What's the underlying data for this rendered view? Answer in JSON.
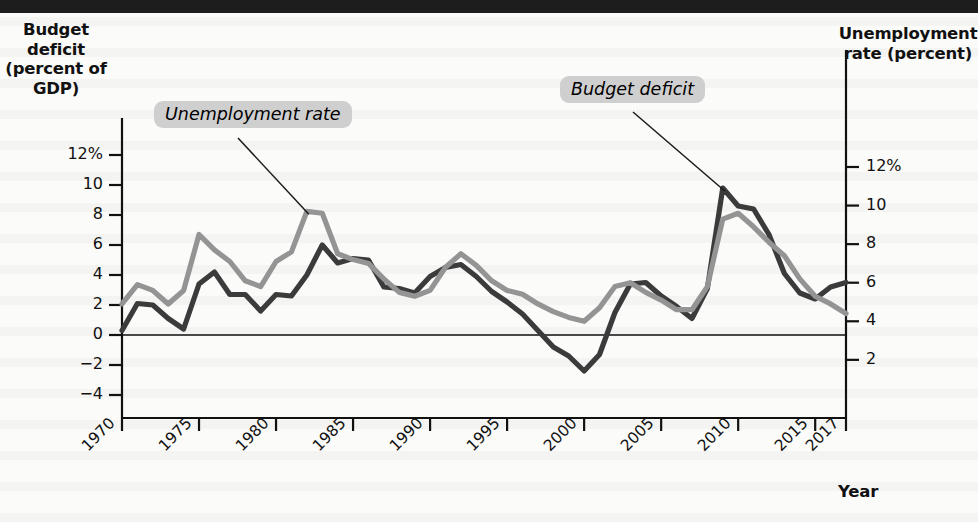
{
  "figure": {
    "left_axis_title": "Budget deficit (percent of GDP)",
    "right_axis_title": "Unemployment rate (percent)",
    "xaxis_title": "Year",
    "callouts": {
      "unemployment": "Unemployment rate",
      "deficit": "Budget deficit"
    },
    "colors": {
      "deficit_line": "#3b3b3b",
      "unemployment_line": "#949494",
      "axis": "#111111",
      "callout_background": "#cfcfcf",
      "page_background": "#fbfbf9",
      "topbar": "#1d1d1d"
    }
  },
  "chart_data": {
    "type": "line",
    "title": "",
    "xlabel": "Year",
    "grid": false,
    "legend_position": "inline-callouts",
    "x": [
      1970,
      1971,
      1972,
      1973,
      1974,
      1975,
      1976,
      1977,
      1978,
      1979,
      1980,
      1981,
      1982,
      1983,
      1984,
      1985,
      1986,
      1987,
      1988,
      1989,
      1990,
      1991,
      1992,
      1993,
      1994,
      1995,
      1996,
      1997,
      1998,
      1999,
      2000,
      2001,
      2002,
      2003,
      2004,
      2005,
      2006,
      2007,
      2008,
      2009,
      2010,
      2011,
      2012,
      2013,
      2014,
      2015,
      2016,
      2017
    ],
    "xtick_labels": [
      "1970",
      "1975",
      "1980",
      "1985",
      "1990",
      "1995",
      "2000",
      "2005",
      "2010",
      "2015",
      "2017"
    ],
    "xtick_values": [
      1970,
      1975,
      1980,
      1985,
      1990,
      1995,
      2000,
      2005,
      2010,
      2015,
      2017
    ],
    "left_axis": {
      "label": "Budget deficit (percent of GDP)",
      "ylim": [
        -5.0,
        13.0
      ],
      "ticks": [
        12,
        10,
        8,
        6,
        4,
        2,
        0,
        -2,
        -4
      ],
      "tick_labels": [
        "12%",
        "10",
        "8",
        "6",
        "4",
        "2",
        "0",
        "−2",
        "−4"
      ]
    },
    "right_axis": {
      "label": "Unemployment rate (percent)",
      "ylim": [
        -0.6,
        13.4
      ],
      "ticks": [
        12,
        10,
        8,
        6,
        4,
        2
      ],
      "tick_labels": [
        "12%",
        "10",
        "8",
        "6",
        "4",
        "2"
      ]
    },
    "series": [
      {
        "name": "Budget deficit",
        "axis": "left",
        "color": "#3b3b3b",
        "values": [
          0.3,
          2.1,
          2.0,
          1.1,
          0.4,
          3.4,
          4.2,
          2.7,
          2.7,
          1.6,
          2.7,
          2.6,
          4.0,
          6.0,
          4.8,
          5.1,
          5.0,
          3.2,
          3.1,
          2.8,
          3.9,
          4.5,
          4.7,
          3.9,
          2.9,
          2.2,
          1.4,
          0.3,
          -0.8,
          -1.4,
          -2.4,
          -1.3,
          1.5,
          3.4,
          3.5,
          2.6,
          1.9,
          1.1,
          3.1,
          9.8,
          8.6,
          8.4,
          6.7,
          4.1,
          2.8,
          2.4,
          3.2,
          3.5
        ]
      },
      {
        "name": "Unemployment rate",
        "axis": "right",
        "color": "#949494",
        "values": [
          4.9,
          5.9,
          5.6,
          4.9,
          5.6,
          8.5,
          7.7,
          7.1,
          6.1,
          5.8,
          7.1,
          7.6,
          9.7,
          9.6,
          7.5,
          7.2,
          7.0,
          6.2,
          5.5,
          5.3,
          5.6,
          6.8,
          7.5,
          6.9,
          6.1,
          5.6,
          5.4,
          4.9,
          4.5,
          4.2,
          4.0,
          4.7,
          5.8,
          6.0,
          5.5,
          5.1,
          4.6,
          4.6,
          5.8,
          9.3,
          9.6,
          8.9,
          8.1,
          7.4,
          6.2,
          5.3,
          4.9,
          4.4
        ]
      }
    ],
    "annotations": [
      {
        "text": "Unemployment rate",
        "points_to_year": 1982,
        "style": "callout"
      },
      {
        "text": "Budget deficit",
        "points_to_year": 2009,
        "style": "callout"
      }
    ]
  }
}
